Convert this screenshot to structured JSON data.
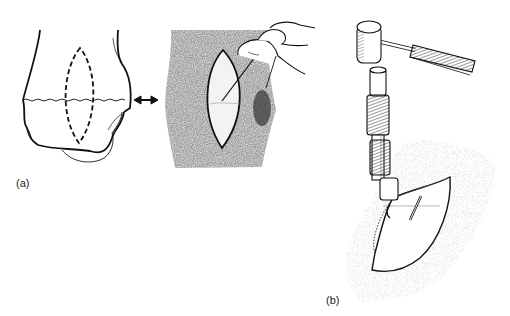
{
  "figure": {
    "panels": [
      {
        "id": "a",
        "label": "(a)",
        "description": "Bone outline with dashed lenticular marking and corresponding skin incision with needle"
      },
      {
        "id": "b",
        "label": "(b)",
        "description": "Mallet striking a punch/osteotome inserted through lenticular skin incision with pin marker"
      }
    ],
    "icons": {
      "connector": "double-arrow-icon"
    },
    "colors": {
      "ink": "#111111",
      "skin_texture": "#8a8a8a",
      "skin_texture_light": "#c8c8c8",
      "background": "#ffffff"
    }
  }
}
